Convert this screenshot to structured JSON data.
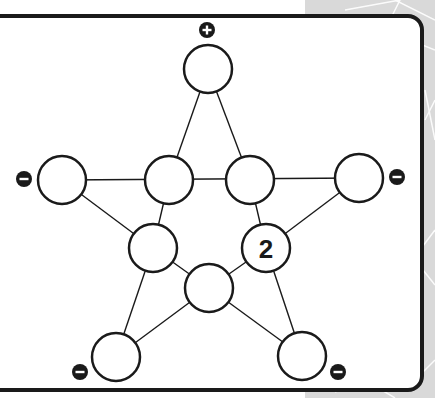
{
  "puzzle": {
    "type": "pentagram-number-placement",
    "colors": {
      "line": "#1a1a1a",
      "node_fill": "#ffffff",
      "badge": "#1a1a1a",
      "background_deco": "#d9d9d9"
    },
    "nodes": [
      {
        "id": "top",
        "x": 208,
        "y": 69,
        "value": ""
      },
      {
        "id": "upper-left",
        "x": 62,
        "y": 180,
        "value": ""
      },
      {
        "id": "inner-left",
        "x": 169,
        "y": 180,
        "value": ""
      },
      {
        "id": "inner-right",
        "x": 250,
        "y": 180,
        "value": ""
      },
      {
        "id": "upper-right",
        "x": 359,
        "y": 178,
        "value": ""
      },
      {
        "id": "mid-left",
        "x": 153,
        "y": 248,
        "value": ""
      },
      {
        "id": "mid-right",
        "x": 266,
        "y": 248,
        "value": "2"
      },
      {
        "id": "center-bottom",
        "x": 209,
        "y": 288,
        "value": ""
      },
      {
        "id": "bottom-left",
        "x": 116,
        "y": 357,
        "value": ""
      },
      {
        "id": "bottom-right",
        "x": 302,
        "y": 356,
        "value": ""
      }
    ],
    "badges": [
      {
        "id": "top",
        "symbol": "+",
        "x": 207,
        "y": 30
      },
      {
        "id": "upper-left",
        "symbol": "−",
        "x": 24,
        "y": 179
      },
      {
        "id": "upper-right",
        "symbol": "−",
        "x": 397,
        "y": 177
      },
      {
        "id": "bottom-left",
        "symbol": "−",
        "x": 80,
        "y": 372
      },
      {
        "id": "bottom-right",
        "symbol": "−",
        "x": 338,
        "y": 372
      }
    ],
    "given_value": "2"
  }
}
